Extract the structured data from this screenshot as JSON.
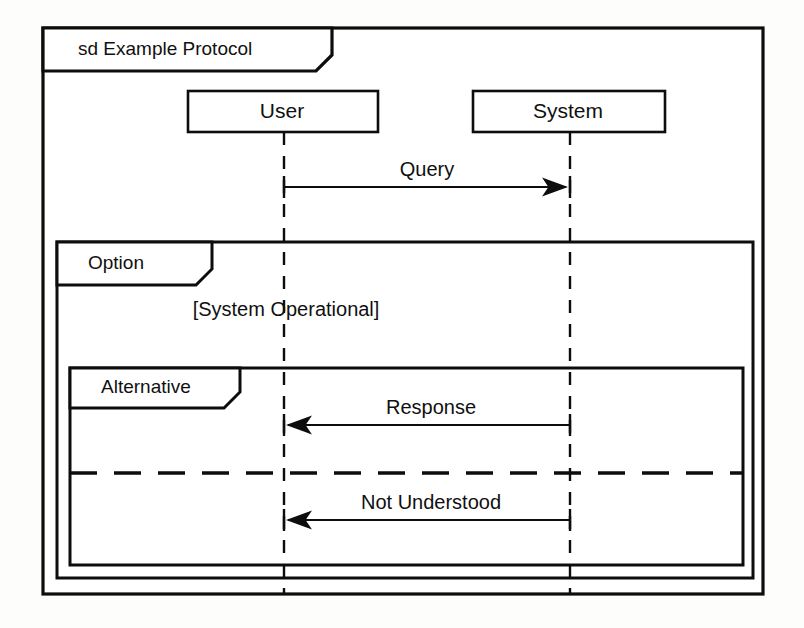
{
  "diagram": {
    "kind": "uml-sequence-diagram",
    "frame_title": "sd Example Protocol",
    "width": 804,
    "height": 628,
    "background_color": "#fdfdfc",
    "line_color": "#0d0d0d",
    "fill_color": "#ffffff"
  },
  "lifelines": [
    {
      "name": "User",
      "x": 284,
      "box_left": 188,
      "box_right": 378,
      "box_top": 91,
      "box_bottom": 132
    },
    {
      "name": "System",
      "x": 570,
      "box_left": 473,
      "box_right": 665,
      "box_top": 91,
      "box_bottom": 132
    }
  ],
  "messages": [
    {
      "label": "Query",
      "from": "User",
      "to": "System",
      "direction": "right",
      "y": 187,
      "style": "solid",
      "arrowhead": "filled"
    },
    {
      "label": "Response",
      "from": "System",
      "to": "User",
      "direction": "left",
      "y": 425,
      "style": "solid",
      "arrowhead": "filled"
    },
    {
      "label": "Not Understood",
      "from": "System",
      "to": "User",
      "direction": "left",
      "y": 520,
      "style": "solid",
      "arrowhead": "filled"
    }
  ],
  "fragments": [
    {
      "operator_label": "Option",
      "guard": "[System Operational]",
      "left": 57,
      "right": 753,
      "top": 242,
      "bottom": 578,
      "tab_width": 155,
      "tab_height": 43
    },
    {
      "operator_label": "Alternative",
      "guard": "",
      "left": 70,
      "right": 743,
      "top": 368,
      "bottom": 565,
      "tab_width": 170,
      "tab_height": 40,
      "operand_divider_y": 473
    }
  ],
  "outer_frame": {
    "left": 43,
    "right": 763,
    "top": 28,
    "bottom": 594,
    "tab_width": 289,
    "tab_height": 43
  }
}
